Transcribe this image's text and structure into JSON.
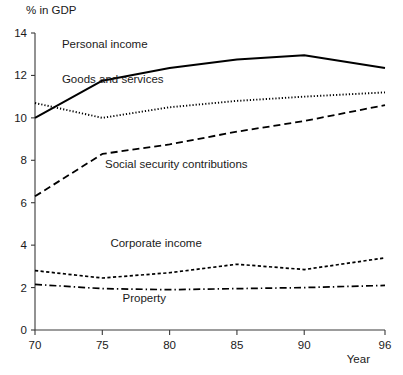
{
  "chart_data": {
    "type": "line",
    "title": "",
    "ylabel": "% in GDP",
    "xlabel": "Year",
    "xlim": [
      70,
      96
    ],
    "ylim": [
      0,
      14
    ],
    "grid": false,
    "legend_position": "inline-labels",
    "x_ticks": [
      "70",
      "75",
      "80",
      "85",
      "90",
      "96"
    ],
    "x_tick_values": [
      70,
      75,
      80,
      85,
      90,
      96
    ],
    "y_ticks": [
      "0",
      "2",
      "4",
      "6",
      "8",
      "10",
      "12",
      "14"
    ],
    "y_tick_values": [
      0,
      2,
      4,
      6,
      8,
      10,
      12,
      14
    ],
    "x": [
      70,
      75,
      80,
      85,
      90,
      96
    ],
    "series": [
      {
        "name": "Personal income",
        "style": "solid",
        "color": "#000000",
        "values": [
          10.0,
          11.75,
          12.35,
          12.75,
          12.95,
          12.35
        ],
        "label_x": 72,
        "label_y": 13.3
      },
      {
        "name": "Goods and services",
        "style": "dotted",
        "color": "#000000",
        "values": [
          10.7,
          10.0,
          10.5,
          10.8,
          11.0,
          11.2
        ],
        "label_x": 72,
        "label_y": 11.65
      },
      {
        "name": "Social security contributions",
        "style": "dashed",
        "color": "#000000",
        "values": [
          6.3,
          8.3,
          8.75,
          9.35,
          9.85,
          10.6
        ],
        "label_x": 75.2,
        "label_y": 7.65
      },
      {
        "name": "Corporate income",
        "style": "dashed-fine",
        "color": "#000000",
        "values": [
          2.8,
          2.45,
          2.7,
          3.1,
          2.85,
          3.4
        ],
        "label_x": 75.6,
        "label_y": 3.9
      },
      {
        "name": "Property",
        "style": "dash-dot",
        "color": "#000000",
        "values": [
          2.15,
          1.95,
          1.9,
          1.95,
          2.0,
          2.1
        ],
        "label_x": 76.5,
        "label_y": 1.3
      }
    ]
  },
  "axes": {
    "y_axis_caption": "% in GDP",
    "x_axis_caption": "Year"
  }
}
